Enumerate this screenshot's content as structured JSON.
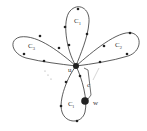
{
  "diagram": {
    "type": "flower-graph",
    "center_vertex": {
      "label": "u"
    },
    "special_vertex": {
      "label": "w"
    },
    "path_label": "c",
    "ellipsis": "...",
    "loops": [
      {
        "id": "top",
        "label": "C",
        "subscript": "1"
      },
      {
        "id": "right",
        "label": "C",
        "subscript": "2"
      },
      {
        "id": "left",
        "label": "C",
        "subscript": "3"
      },
      {
        "id": "bottom",
        "label": "C",
        "subscript": "l"
      }
    ],
    "colors": {
      "stroke": "#333333",
      "vertex": "#222222",
      "background": "#ffffff"
    }
  }
}
